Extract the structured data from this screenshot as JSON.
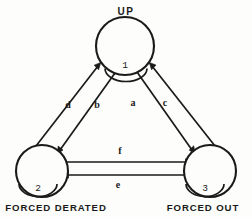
{
  "diagram": {
    "type": "state-transition-diagram",
    "title": "",
    "background_color": "#fdfdfb",
    "line_color": "#1a1a1a",
    "nodes": [
      {
        "id": "1",
        "number": "1",
        "label": "UP",
        "label_position": "above",
        "cx": 125,
        "cy": 46,
        "r": 29,
        "number_x": 125,
        "number_y": 65
      },
      {
        "id": "2",
        "number": "2",
        "label": "FORCED DERATED",
        "label_position": "below",
        "cx": 42,
        "cy": 171,
        "r": 26,
        "number_x": 38,
        "number_y": 188
      },
      {
        "id": "3",
        "number": "3",
        "label": "FORCED OUT",
        "label_position": "below",
        "cx": 210,
        "cy": 171,
        "r": 26,
        "number_x": 204,
        "number_y": 188
      }
    ],
    "edges": [
      {
        "label": "d",
        "from": "2",
        "to": "1",
        "label_x": 68,
        "label_y": 106
      },
      {
        "label": "b",
        "from": "1",
        "to": "2",
        "label_x": 97,
        "label_y": 106
      },
      {
        "label": "a",
        "from": "1",
        "to": "3",
        "label_x": 133,
        "label_y": 104
      },
      {
        "label": "c",
        "from": "3",
        "to": "1",
        "label_x": 165,
        "label_y": 104
      },
      {
        "label": "f",
        "from": "2",
        "to": "3",
        "label_x": 120,
        "label_y": 152
      },
      {
        "label": "e",
        "from": "3",
        "to": "2",
        "label_x": 118,
        "label_y": 186
      }
    ]
  }
}
